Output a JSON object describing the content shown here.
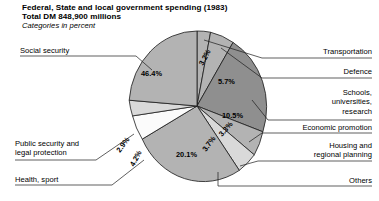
{
  "header": {
    "line1": "Federal, State and local government spending (1983)",
    "line2": "Total DM 848,900 millions",
    "line3": "Categories in percent"
  },
  "colors": {
    "background": "#ffffff",
    "outline": "#1b1b1b",
    "slice_mid_gray": "#b3b3b3",
    "slice_dark_gray": "#8f8f8f",
    "slice_light_gray": "#d9d9d9",
    "slice_white": "#fbfbfb"
  },
  "chart_data": {
    "type": "pie",
    "title": "Federal, State and local government spending (1983)",
    "subtitle": "Total DM 848,900 millions",
    "units_note": "Categories in percent",
    "total_label": "Total DM 848,900 millions",
    "year": "1983",
    "legend_position": "callout-labels",
    "grid": false,
    "categories": [
      "Transportation",
      "Defence",
      "Schools, universities, research",
      "Economic promotion",
      "Housing and regional planning",
      "Others",
      "Health, sport",
      "Public security and legal protection",
      "Social security"
    ],
    "values": [
      3.2,
      5.7,
      10.5,
      3.3,
      3.7,
      20.1,
      4.2,
      2.9,
      46.4
    ],
    "value_labels": [
      "3.2%",
      "5.7%",
      "10.5%",
      "3.3%",
      "3.7%",
      "20.1%",
      "4.2%",
      "2.9%",
      "46.4%"
    ],
    "sum": 100.0,
    "slice_fills": [
      "#b3b3b3",
      "#b3b3b3",
      "#8f8f8f",
      "#b3b3b3",
      "#d9d9d9",
      "#b3b3b3",
      "#fbfbfb",
      "#d9d9d9",
      "#b3b3b3"
    ]
  },
  "callouts": {
    "social_security": "Social security",
    "public_security": "Public security and\nlegal protection",
    "health_sport": "Health, sport",
    "transportation": "Transportation",
    "defence": "Defence",
    "schools": "Schools,\nuniversities,\nresearch",
    "economic_promotion": "Economic promotion",
    "housing": "Housing and\nregional planning",
    "others": "Others"
  },
  "pct": {
    "social_security": "46.4%",
    "transportation": "3.2%",
    "defence": "5.7%",
    "schools": "10.5%",
    "economic_promotion": "3.3%",
    "housing": "3.7%",
    "others": "20.1%",
    "health_sport": "4.2%",
    "public_security": "2.9%"
  }
}
